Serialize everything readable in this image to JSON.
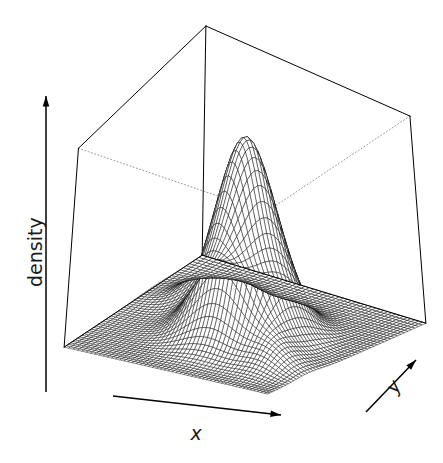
{
  "figure": {
    "kind": "perspective-wireframe-surface",
    "background_color": "#ffffff",
    "line_color": "#000000",
    "hidden_edge_color": "#999999",
    "width": 443,
    "height": 463
  },
  "labels": {
    "z_axis": "density",
    "x_axis": "x",
    "y_axis": "y"
  },
  "icons": {
    "x_arrow": "arrow-right-icon",
    "y_arrow": "arrow-up-right-icon",
    "z_arrow": "arrow-up-icon"
  },
  "chart_data": {
    "type": "surface",
    "title": "",
    "xlabel": "x",
    "ylabel": "y",
    "zlabel": "density",
    "grid": false,
    "legend": null,
    "axis_ticks_shown": false,
    "box": true,
    "hidden_edges_dotted": true,
    "projection": {
      "theta_deg": -35,
      "phi_deg": 22,
      "style": "persp"
    },
    "mesh": {
      "nx": 52,
      "ny": 52
    },
    "xlim": [
      -3.2,
      3.2
    ],
    "ylim": [
      -3.2,
      3.2
    ],
    "zlim": [
      0,
      0.173
    ],
    "surface_model": "sum_of_bivariate_gaussians",
    "components": [
      {
        "name": "main-peak",
        "weight": 1.0,
        "mu_x": 0.25,
        "mu_y": 0.1,
        "sigma_x": 0.82,
        "sigma_y": 0.82,
        "rho": 0.0
      },
      {
        "name": "left-shoulder",
        "weight": 0.16,
        "mu_x": -1.55,
        "mu_y": -1.15,
        "sigma_x": 0.62,
        "sigma_y": 0.62,
        "rho": 0.0
      },
      {
        "name": "right-shoulder",
        "weight": 0.1,
        "mu_x": 2.0,
        "mu_y": 1.35,
        "sigma_x": 0.6,
        "sigma_y": 0.6,
        "rho": 0.0
      }
    ],
    "peak_value": 0.173
  }
}
